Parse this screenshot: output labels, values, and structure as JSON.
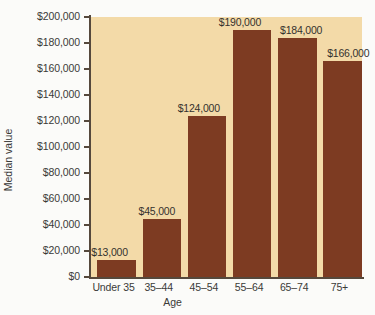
{
  "chart_data": {
    "type": "bar",
    "title": "",
    "subtitle": "",
    "xlabel": "Age",
    "ylabel": "Median value",
    "categories": [
      "Under 35",
      "35–44",
      "45–54",
      "55–64",
      "65–74",
      "75+"
    ],
    "values": [
      13000,
      45000,
      124000,
      190000,
      184000,
      166000
    ],
    "data_labels": [
      "$13,000",
      "$45,000",
      "$124,000",
      "$190,000",
      "$184,000",
      "$166,000"
    ],
    "ylim": [
      0,
      200000
    ],
    "ytick_values": [
      0,
      20000,
      40000,
      60000,
      80000,
      100000,
      120000,
      140000,
      160000,
      180000,
      200000
    ],
    "ytick_labels": [
      "$0",
      "$20,000",
      "$40,000",
      "$60,000",
      "$80,000",
      "$100,000",
      "$120,000",
      "$140,000",
      "$160,000",
      "$180,000",
      "$200,000"
    ],
    "grid": false,
    "legend": false,
    "legend_position": "none",
    "series": [
      {
        "name": "Median value",
        "values": [
          13000,
          45000,
          124000,
          190000,
          184000,
          166000
        ]
      }
    ],
    "colors": {
      "bar": "#7d3b22",
      "plot_background": "#f3daa8",
      "canvas_background": "#fbfbf9",
      "axis": "#55483c",
      "text": "#3a3a38"
    }
  }
}
